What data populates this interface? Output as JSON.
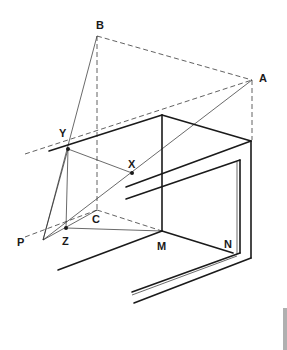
{
  "diagram": {
    "type": "geometric perspective construction",
    "points": {
      "A": {
        "label": "A",
        "x": 252,
        "y": 80
      },
      "B": {
        "label": "B",
        "x": 97,
        "y": 36
      },
      "C": {
        "label": "C",
        "x": 97,
        "y": 210
      },
      "X": {
        "label": "X",
        "x": 132,
        "y": 173
      },
      "Y": {
        "label": "Y",
        "x": 68,
        "y": 149
      },
      "Z": {
        "label": "Z",
        "x": 66,
        "y": 228
      },
      "P": {
        "label": "P",
        "x": 43,
        "y": 240
      },
      "M": {
        "label": "M",
        "x": 162,
        "y": 231
      },
      "N": {
        "label": "N",
        "x": 233,
        "y": 253
      }
    },
    "colors": {
      "line": "#1a1a1a",
      "background": "#ffffff",
      "scrollbar": "#b0b0b0"
    }
  }
}
